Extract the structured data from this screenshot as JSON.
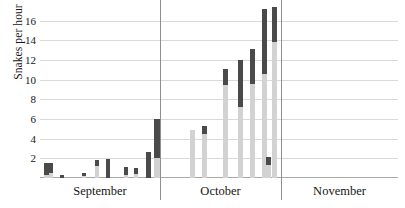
{
  "chart_data": {
    "type": "bar",
    "title": "",
    "subtitle": "",
    "xlabel": "",
    "ylabel": "Snakes per hour",
    "ylim": [
      0,
      17.5
    ],
    "yticks": [
      2,
      4,
      6,
      8,
      10,
      12,
      14,
      16
    ],
    "grid": true,
    "legend": null,
    "stacked": true,
    "xlabel_groups": [
      "September",
      "October",
      "November"
    ],
    "group_boundaries_px": [
      160,
      281
    ],
    "series": [
      {
        "name": "lower-segment",
        "color": "#d2d2d2",
        "values": [
          0.35,
          0.55,
          0.0,
          0.25,
          0.0,
          0.15,
          0.0,
          1.25,
          0.0,
          0.0,
          0.35,
          0.45,
          0.0,
          0.0,
          2.05,
          4.7,
          5.0,
          4.45,
          9.45,
          7.2,
          9.6,
          10.6,
          1.35,
          13.8,
          11.6
        ]
      },
      {
        "name": "upper-segment",
        "color": "#4a4a4a",
        "values": [
          1.15,
          0.95,
          0.35,
          1.05,
          0.25,
          0.85,
          0.3,
          0.55,
          1.55,
          0.35,
          0.75,
          0.55,
          1.7,
          2.55,
          1.5,
          1.6,
          0.0,
          0.55,
          1.65,
          3.9,
          2.2,
          3.6,
          0.75,
          3.9,
          5.9
        ]
      }
    ],
    "bars": [
      {
        "x_px": 44,
        "width_px": 5,
        "light": 0.35,
        "dark": 1.15,
        "total": 1.5,
        "month": "September"
      },
      {
        "x_px": 49,
        "width_px": 4,
        "light": 0.55,
        "dark": 0.95,
        "total": 1.5,
        "month": "September"
      },
      {
        "x_px": 60,
        "width_px": 4,
        "light": 0.0,
        "dark": 0.35,
        "total": 0.35,
        "month": "September"
      },
      {
        "x_px": 82,
        "width_px": 4,
        "light": 0.25,
        "dark": 0.25,
        "total": 0.5,
        "month": "September"
      },
      {
        "x_px": 95,
        "width_px": 4,
        "light": 1.25,
        "dark": 0.55,
        "total": 1.8,
        "month": "September"
      },
      {
        "x_px": 106,
        "width_px": 4,
        "light": 0.0,
        "dark": 1.9,
        "total": 1.9,
        "month": "September"
      },
      {
        "x_px": 124,
        "width_px": 4,
        "light": 0.35,
        "dark": 0.75,
        "total": 1.1,
        "month": "September"
      },
      {
        "x_px": 134,
        "width_px": 4,
        "light": 0.45,
        "dark": 0.55,
        "total": 1.0,
        "month": "September"
      },
      {
        "x_px": 146,
        "width_px": 5,
        "light": 0.0,
        "dark": 2.6,
        "total": 2.6,
        "month": "September"
      },
      {
        "x_px": 154,
        "width_px": 6,
        "light": 2.05,
        "dark": 4.0,
        "total": 6.05,
        "month": "September"
      },
      {
        "x_px": 190,
        "width_px": 5,
        "light": 4.9,
        "dark": 0.0,
        "total": 4.9,
        "month": "October"
      },
      {
        "x_px": 202,
        "width_px": 5,
        "light": 4.45,
        "dark": 0.85,
        "total": 5.3,
        "month": "October"
      },
      {
        "x_px": 223,
        "width_px": 5,
        "light": 9.45,
        "dark": 1.65,
        "total": 11.1,
        "month": "October"
      },
      {
        "x_px": 238,
        "width_px": 5,
        "light": 7.2,
        "dark": 4.8,
        "total": 12.0,
        "month": "October"
      },
      {
        "x_px": 250,
        "width_px": 5,
        "light": 9.6,
        "dark": 3.5,
        "total": 13.1,
        "month": "October"
      },
      {
        "x_px": 262,
        "width_px": 5,
        "light": 10.6,
        "dark": 6.6,
        "total": 17.2,
        "month": "October"
      },
      {
        "x_px": 266,
        "width_px": 5,
        "light": 1.35,
        "dark": 0.75,
        "total": 2.1,
        "month": "October"
      },
      {
        "x_px": 272,
        "width_px": 5,
        "light": 13.8,
        "dark": 3.6,
        "total": 17.4,
        "month": "October"
      }
    ]
  }
}
